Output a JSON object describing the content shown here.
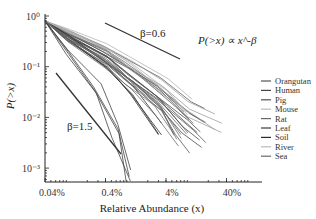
{
  "chart_data": {
    "type": "line",
    "title": "",
    "xlabel": "Relative Abundance (x)",
    "ylabel": "P(>x)",
    "xscale": "log",
    "yscale": "log",
    "xlim": [
      0.0004,
      0.8
    ],
    "ylim": [
      0.0005,
      1
    ],
    "x_ticks": [
      0.0004,
      0.004,
      0.04,
      0.4
    ],
    "x_tick_labels": [
      "0.04%",
      "0.4%",
      "4%",
      "40%"
    ],
    "y_ticks": [
      1,
      0.1,
      0.01,
      0.001
    ],
    "y_tick_labels": [
      "10⁰",
      "10⁻¹",
      "10⁻²",
      "10⁻³"
    ],
    "grid": false,
    "legend_position": "right",
    "legend": [
      "Orangutan",
      "Human",
      "Pig",
      "Mouse",
      "Rat",
      "Leaf",
      "Soil",
      "River",
      "Sea"
    ],
    "annotations": {
      "formula": "P(>x) ∝ x^-β",
      "ref_line_shallow": "β=0.6",
      "ref_line_steep": "β=1.5"
    },
    "reference_lines": [
      {
        "label": "β=0.6",
        "slope": -0.6
      },
      {
        "label": "β=1.5",
        "slope": -1.5
      }
    ],
    "series": [
      {
        "name": "Orangutan",
        "color": "#555555",
        "x": [
          0.0004,
          0.001,
          0.004,
          0.01,
          0.03,
          0.1,
          0.2
        ],
        "y": [
          0.8,
          0.45,
          0.2,
          0.1,
          0.04,
          0.012,
          0.008
        ]
      },
      {
        "name": "Human",
        "color": "#444444",
        "x": [
          0.0004,
          0.001,
          0.004,
          0.01,
          0.03,
          0.08,
          0.15
        ],
        "y": [
          0.8,
          0.4,
          0.17,
          0.08,
          0.03,
          0.01,
          0.006
        ]
      },
      {
        "name": "Pig",
        "color": "#505050",
        "x": [
          0.0004,
          0.001,
          0.004,
          0.01,
          0.03,
          0.06,
          0.1
        ],
        "y": [
          0.8,
          0.38,
          0.15,
          0.07,
          0.025,
          0.01,
          0.005
        ]
      },
      {
        "name": "Mouse",
        "color": "#9a9a9a",
        "x": [
          0.0004,
          0.001,
          0.004,
          0.01,
          0.03,
          0.1,
          0.3
        ],
        "y": [
          0.8,
          0.5,
          0.25,
          0.12,
          0.05,
          0.018,
          0.01
        ]
      },
      {
        "name": "Rat",
        "color": "#666666",
        "x": [
          0.0004,
          0.001,
          0.004,
          0.01,
          0.03,
          0.08
        ],
        "y": [
          0.8,
          0.42,
          0.18,
          0.09,
          0.03,
          0.008
        ]
      },
      {
        "name": "Leaf",
        "color": "#3a3a3a",
        "x": [
          0.0004,
          0.001,
          0.003,
          0.006,
          0.01
        ],
        "y": [
          0.8,
          0.2,
          0.04,
          0.006,
          0.0007
        ]
      },
      {
        "name": "Soil",
        "color": "#2a2a2a",
        "x": [
          0.0004,
          0.001,
          0.004,
          0.01,
          0.03
        ],
        "y": [
          0.8,
          0.35,
          0.1,
          0.03,
          0.005
        ]
      },
      {
        "name": "River",
        "color": "#b0b0b0",
        "x": [
          0.0004,
          0.001,
          0.004,
          0.01,
          0.04,
          0.1
        ],
        "y": [
          0.8,
          0.48,
          0.22,
          0.11,
          0.035,
          0.012
        ]
      },
      {
        "name": "Sea",
        "color": "#6a6a6a",
        "x": [
          0.0004,
          0.001,
          0.004,
          0.01,
          0.03,
          0.06
        ],
        "y": [
          0.8,
          0.36,
          0.14,
          0.06,
          0.02,
          0.006
        ]
      }
    ]
  }
}
